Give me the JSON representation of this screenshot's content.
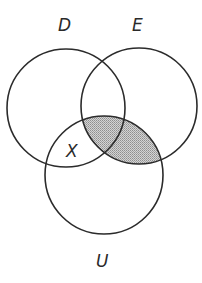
{
  "diagram": {
    "type": "venn",
    "sets": [
      {
        "name": "D",
        "label": "D",
        "cx": 66,
        "cy": 108,
        "r": 59
      },
      {
        "name": "E",
        "label": "E",
        "cx": 139,
        "cy": 106,
        "r": 58
      },
      {
        "name": "U",
        "label": "U",
        "cx": 104,
        "cy": 175,
        "r": 59
      }
    ],
    "region_label": "X",
    "shaded_region": "E ∩ U",
    "colors": {
      "stroke": "#2b2b2b",
      "shade": "#b9b9b9",
      "background": "#ffffff"
    }
  },
  "labels": {
    "d": "D",
    "e": "E",
    "u": "U",
    "x": "X"
  }
}
